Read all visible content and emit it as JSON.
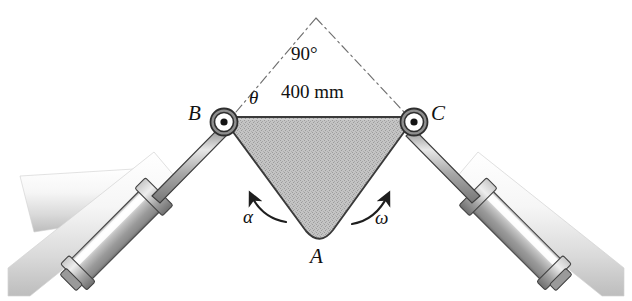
{
  "figure": {
    "type": "mechanism-diagram",
    "background_color": "#ffffff"
  },
  "labels": {
    "vertex_b": "B",
    "vertex_c": "C",
    "vertex_a": "A",
    "theta": "θ",
    "alpha": "α",
    "omega": "ω",
    "apex_angle": "90°",
    "top_dimension": "400 mm"
  },
  "geometry": {
    "triangle": {
      "b": [
        222,
        118
      ],
      "c": [
        415,
        118
      ],
      "a": [
        318,
        243
      ],
      "fill": "#b9b9b9",
      "stroke": "#3a3a3a"
    },
    "apex": [
      316,
      18
    ],
    "pin_b": [
      224,
      122
    ],
    "pin_c": [
      414,
      122
    ],
    "pin_radius": 13
  },
  "parts": {
    "left_cylinder_label": "hydraulic-cylinder-left",
    "right_cylinder_label": "hydraulic-cylinder-right",
    "left_support_label": "support-band-left",
    "right_support_label": "support-band-right",
    "rod_label": "piston-rod"
  },
  "colors": {
    "body_fill": "#b9b9b9",
    "body_stroke": "#3a3a3a",
    "metal_light": "#f2f2f2",
    "metal_mid": "#b0b0b0",
    "metal_dark": "#6e6e6e",
    "line": "#2b2b2b",
    "dash_line": "#6a6a6a",
    "support_light": "#fbfbfb",
    "support_mid": "#d8d8d8"
  }
}
